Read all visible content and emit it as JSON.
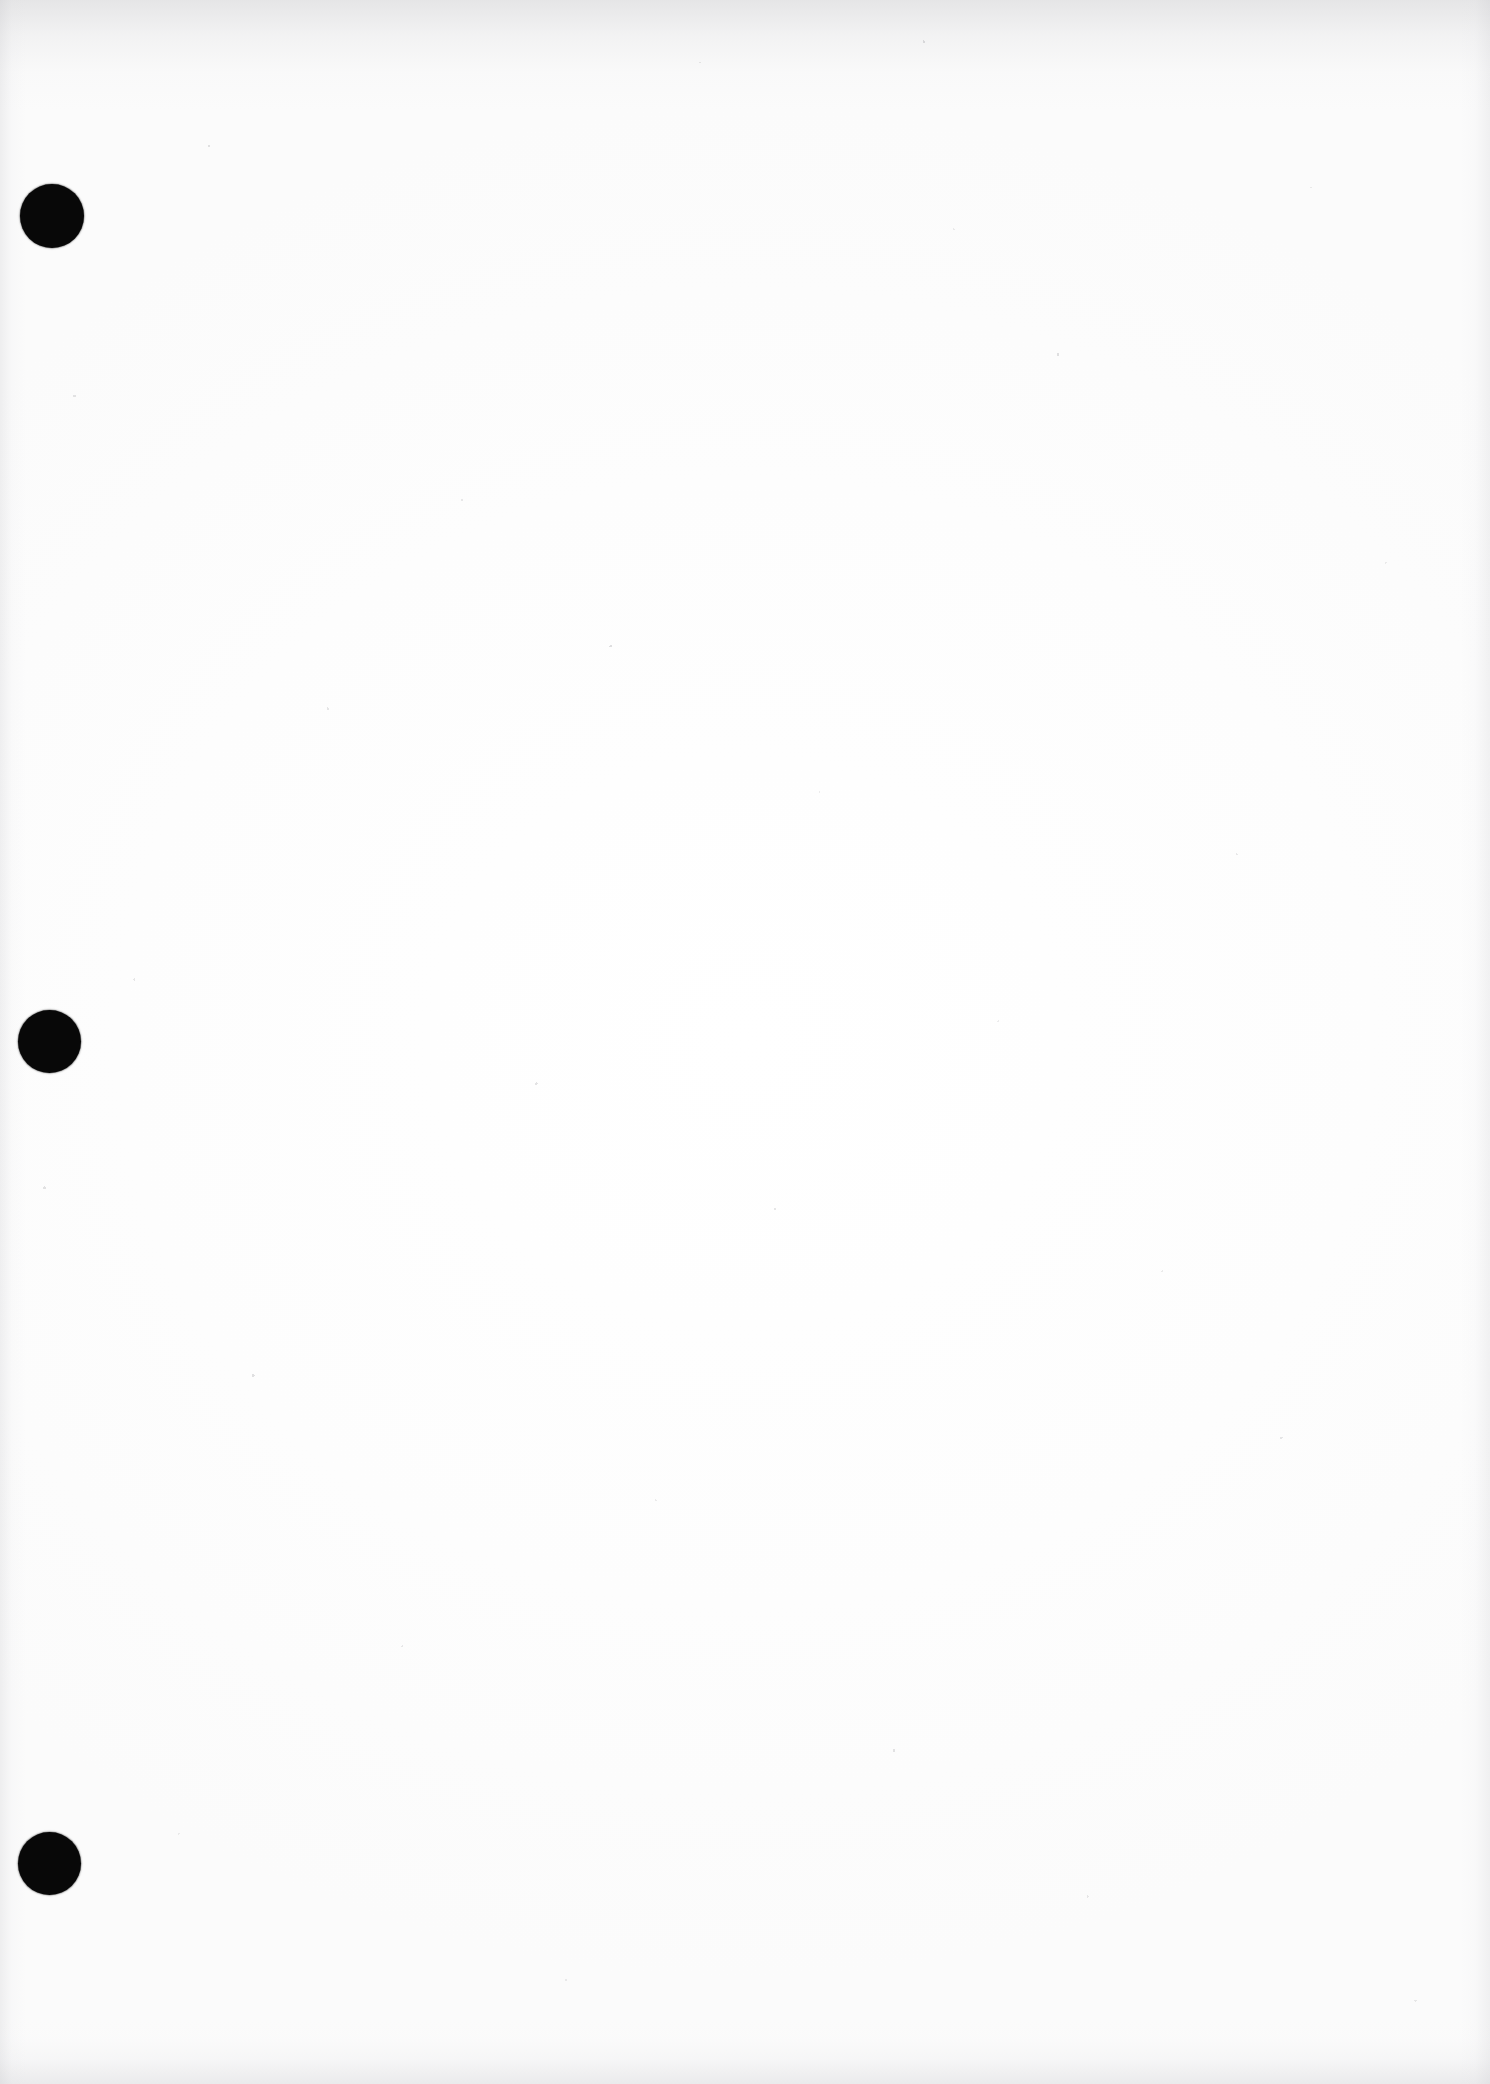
{
  "document": {
    "kind": "scanned-paper-page",
    "page_state": "blank",
    "visible_text": "",
    "body_text": "",
    "orientation": "portrait",
    "width_px": 1490,
    "height_px": 2084
  },
  "colors": {
    "paper": "#fdfdfd",
    "paper_highlight": "#ffffff",
    "paper_shadow": "#fbfbfb",
    "punch_hole": "#080808",
    "edge_shade_top": "#a8a8ac",
    "edge_shade_bottom": "#c4c4c8",
    "edge_shade_side": "#bebec3",
    "speckle": "#5a5a5f"
  },
  "punch_holes": {
    "count": 3,
    "shape": "circle",
    "description": "three-ring binder punch holes along the left margin",
    "items": [
      {
        "name": "top",
        "center_x": 52,
        "center_y": 216,
        "diameter": 64
      },
      {
        "name": "middle",
        "center_x": 49,
        "center_y": 1041,
        "diameter": 63
      },
      {
        "name": "bottom",
        "center_x": 49,
        "center_y": 1863,
        "diameter": 63
      }
    ]
  },
  "scan_artifacts": {
    "top_edge_band": true,
    "bottom_edge_band": true,
    "left_edge_band": true,
    "right_edge_band": true,
    "speckle_noise": true,
    "vertical_streaking": true
  }
}
